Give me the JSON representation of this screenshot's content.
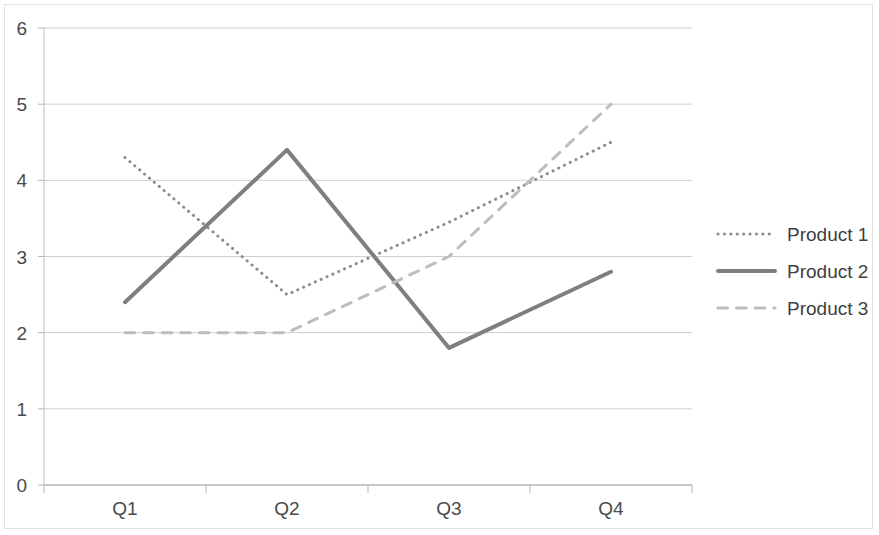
{
  "chart_data": {
    "type": "line",
    "title": "",
    "xlabel": "",
    "ylabel": "",
    "categories": [
      "Q1",
      "Q2",
      "Q3",
      "Q4"
    ],
    "ylim": [
      0,
      6
    ],
    "yticks": [
      "0",
      "1",
      "2",
      "3",
      "4",
      "5",
      "6"
    ],
    "grid": "horizontal",
    "legend_position": "right",
    "series": [
      {
        "name": "Product 1",
        "values": [
          4.3,
          2.5,
          3.45,
          4.5
        ],
        "style": "dotted",
        "color": "#8c8c8c",
        "width": 3
      },
      {
        "name": "Product 2",
        "values": [
          2.4,
          4.4,
          1.8,
          2.8
        ],
        "style": "solid",
        "color": "#7f7f7f",
        "width": 4
      },
      {
        "name": "Product 3",
        "values": [
          2.0,
          2.0,
          3.0,
          5.0
        ],
        "style": "dashed",
        "color": "#bdbdbd",
        "width": 3
      }
    ]
  },
  "axis": {
    "y_ticks": [
      {
        "label": "6",
        "value": 6
      },
      {
        "label": "5",
        "value": 5
      },
      {
        "label": "4",
        "value": 4
      },
      {
        "label": "3",
        "value": 3
      },
      {
        "label": "2",
        "value": 2
      },
      {
        "label": "1",
        "value": 1
      },
      {
        "label": "0",
        "value": 0
      }
    ],
    "x_ticks": [
      {
        "label": "Q1"
      },
      {
        "label": "Q2"
      },
      {
        "label": "Q3"
      },
      {
        "label": "Q4"
      }
    ]
  },
  "legend": {
    "entries": [
      {
        "label": "Product 1"
      },
      {
        "label": "Product 2"
      },
      {
        "label": "Product 3"
      }
    ]
  },
  "colors": {
    "grid": "#d0d0d0",
    "axis": "#bdbdbd",
    "frame": "#e2e2e2",
    "text": "#4a4a4a"
  }
}
